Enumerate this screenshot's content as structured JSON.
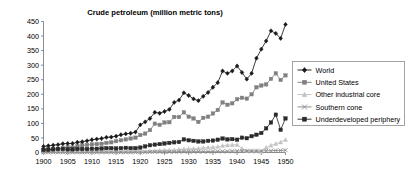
{
  "chart_data": {
    "type": "line",
    "title": "Crude petroleum (million metric tons)",
    "xlabel": "",
    "ylabel": "",
    "xlim": [
      1900,
      1950
    ],
    "ylim": [
      0,
      450
    ],
    "ytick_step": 50,
    "xtick_step": 5,
    "grid": false,
    "legend_position": "right",
    "x": [
      1900,
      1901,
      1902,
      1903,
      1904,
      1905,
      1906,
      1907,
      1908,
      1909,
      1910,
      1911,
      1912,
      1913,
      1914,
      1915,
      1916,
      1917,
      1918,
      1919,
      1920,
      1921,
      1922,
      1923,
      1924,
      1925,
      1926,
      1927,
      1928,
      1929,
      1930,
      1931,
      1932,
      1933,
      1934,
      1935,
      1936,
      1937,
      1938,
      1939,
      1940,
      1941,
      1942,
      1943,
      1944,
      1945,
      1946,
      1947,
      1948,
      1949,
      1950
    ],
    "ytick_labels": [
      "0",
      "50",
      "100",
      "150",
      "200",
      "250",
      "300",
      "350",
      "400",
      "450"
    ],
    "xtick_labels": [
      "1900",
      "1905",
      "1910",
      "1915",
      "1920",
      "1925",
      "1930",
      "1935",
      "1940",
      "1945",
      "1950"
    ],
    "series": [
      {
        "name": "World",
        "color": "#1a1a1a",
        "marker": "diamond",
        "values": [
          21,
          23,
          25,
          27,
          30,
          31,
          31,
          35,
          37,
          40,
          44,
          46,
          48,
          52,
          53,
          56,
          61,
          64,
          66,
          70,
          95,
          105,
          117,
          138,
          135,
          141,
          148,
          172,
          180,
          205,
          196,
          184,
          178,
          193,
          206,
          224,
          240,
          280,
          272,
          280,
          297,
          275,
          252,
          272,
          324,
          355,
          383,
          418,
          409,
          392,
          440
        ]
      },
      {
        "name": "United States",
        "color": "#808080",
        "marker": "square",
        "values": [
          9,
          10,
          12,
          13,
          16,
          18,
          17,
          22,
          24,
          26,
          28,
          29,
          30,
          33,
          35,
          39,
          42,
          45,
          48,
          51,
          60,
          65,
          77,
          99,
          95,
          103,
          104,
          122,
          122,
          138,
          123,
          117,
          105,
          119,
          123,
          134,
          146,
          172,
          164,
          169,
          183,
          188,
          185,
          200,
          224,
          230,
          234,
          253,
          272,
          249,
          265
        ]
      },
      {
        "name": "Other industrial core",
        "color": "#c3c3c3",
        "marker": "triangle",
        "values": [
          2,
          2,
          2,
          2,
          2,
          2,
          2,
          2,
          2,
          3,
          3,
          3,
          3,
          3,
          3,
          3,
          3,
          3,
          3,
          4,
          4,
          4,
          5,
          6,
          7,
          8,
          8,
          9,
          10,
          12,
          13,
          13,
          14,
          16,
          17,
          18,
          20,
          23,
          25,
          26,
          27,
          13,
          6,
          6,
          6,
          4,
          17,
          24,
          30,
          35,
          44
        ]
      },
      {
        "name": "Southern cone",
        "color": "#888888",
        "marker": "cross",
        "values": [
          1,
          1,
          1,
          1,
          1,
          1,
          1,
          1,
          1,
          1,
          1,
          1,
          1,
          1,
          1,
          1,
          1,
          1,
          1,
          1,
          1,
          1,
          2,
          2,
          2,
          2,
          2,
          2,
          3,
          3,
          3,
          3,
          3,
          3,
          3,
          4,
          4,
          4,
          4,
          5,
          5,
          5,
          5,
          5,
          5,
          5,
          6,
          6,
          7,
          7,
          8
        ]
      },
      {
        "name": "Underdeveloped periphery",
        "color": "#2a2a2a",
        "marker": "square",
        "values": [
          9,
          10,
          11,
          12,
          12,
          11,
          11,
          12,
          12,
          12,
          13,
          13,
          14,
          15,
          15,
          14,
          15,
          16,
          15,
          15,
          17,
          21,
          25,
          27,
          29,
          31,
          33,
          35,
          36,
          45,
          42,
          40,
          38,
          38,
          40,
          41,
          44,
          48,
          45,
          46,
          44,
          51,
          49,
          56,
          61,
          67,
          83,
          103,
          130,
          78,
          117
        ]
      }
    ]
  },
  "axes": {
    "y_ticks": [
      0,
      50,
      100,
      150,
      200,
      250,
      300,
      350,
      400,
      450
    ],
    "x_ticks": [
      1900,
      1905,
      1910,
      1915,
      1920,
      1925,
      1930,
      1935,
      1940,
      1945,
      1950
    ]
  },
  "legend": {
    "items": [
      {
        "label": "World",
        "marker": "diamond",
        "color": "#1a1a1a"
      },
      {
        "label": "United States",
        "marker": "square",
        "color": "#808080"
      },
      {
        "label": "Other industrial core",
        "marker": "triangle",
        "color": "#c3c3c3"
      },
      {
        "label": "Southern cone",
        "marker": "cross",
        "color": "#888888"
      },
      {
        "label": "Underdeveloped periphery",
        "marker": "square",
        "color": "#2a2a2a"
      }
    ]
  }
}
